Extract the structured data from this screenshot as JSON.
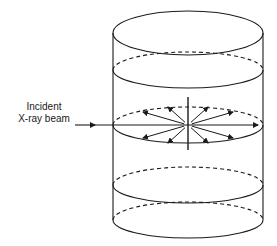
{
  "diagram": {
    "type": "cylinder-scattering-schematic",
    "labels": {
      "beam_line1": "Incident",
      "beam_line2": "X-ray beam"
    },
    "colors": {
      "stroke": "#1a1a1a",
      "background": "#ffffff"
    },
    "cylinder": {
      "cx": 188,
      "rx": 75,
      "top_y": 33,
      "bottom_y": 220,
      "sections": [
        {
          "name": "top",
          "cy": 33,
          "ry": 22,
          "style": "full-solid"
        },
        {
          "name": "section-1",
          "cy": 70,
          "ry": 18,
          "style": "front-solid-back-dashed"
        },
        {
          "name": "beam-plane",
          "cy": 125,
          "ry": 18,
          "style": "front-solid-back-dashed"
        },
        {
          "name": "section-3",
          "cy": 185,
          "ry": 18,
          "style": "front-solid-back-dashed"
        },
        {
          "name": "bottom",
          "cy": 220,
          "ry": 18,
          "style": "front-solid-back-dashed"
        }
      ]
    },
    "beam": {
      "x_start": 75,
      "x_end": 258,
      "y": 125
    },
    "scatter_center": {
      "x": 188,
      "y": 125
    },
    "vertical_axis": {
      "x": 188,
      "y_top": 97,
      "y_bottom": 150
    },
    "scatter_arrows": [
      {
        "dx": -45,
        "dy": -13
      },
      {
        "dx": -20,
        "dy": -18
      },
      {
        "dx": 20,
        "dy": -18
      },
      {
        "dx": 45,
        "dy": -13
      },
      {
        "dx": -45,
        "dy": 13
      },
      {
        "dx": -20,
        "dy": 18
      },
      {
        "dx": 20,
        "dy": 18
      },
      {
        "dx": 45,
        "dy": 13
      }
    ]
  }
}
